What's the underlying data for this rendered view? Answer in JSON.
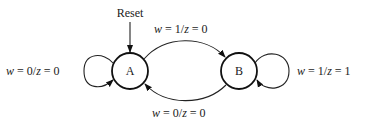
{
  "diagram": {
    "type": "state-machine",
    "reset_label": "Reset",
    "states": [
      {
        "id": "A",
        "label": "A",
        "initial": true
      },
      {
        "id": "B",
        "label": "B",
        "initial": false
      }
    ],
    "transitions": [
      {
        "from": "A",
        "to": "A",
        "label_var": "w",
        "label_rest": " = 0/",
        "label_var2": "z",
        "label_end": " = 0",
        "text": "w = 0/z = 0"
      },
      {
        "from": "A",
        "to": "B",
        "label_var": "w",
        "label_rest": " = 1/",
        "label_var2": "z",
        "label_end": " = 0",
        "text": "w = 1/z = 0"
      },
      {
        "from": "B",
        "to": "B",
        "label_var": "w",
        "label_rest": " = 1/",
        "label_var2": "z",
        "label_end": " = 1",
        "text": "w = 1/z = 1"
      },
      {
        "from": "B",
        "to": "A",
        "label_var": "w",
        "label_rest": " = 0/",
        "label_var2": "z",
        "label_end": " = 0",
        "text": "w = 0/z = 0"
      }
    ]
  }
}
